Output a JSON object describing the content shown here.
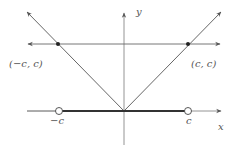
{
  "diagram": {
    "axes": {
      "x_label": "x",
      "y_label": "y"
    },
    "points": [
      {
        "label": "(−c, c)",
        "type": "filled"
      },
      {
        "label": "(c, c)",
        "type": "filled"
      }
    ],
    "x_ticks": [
      {
        "label": "−c",
        "marker": "open-circle"
      },
      {
        "label": "c",
        "marker": "open-circle"
      }
    ],
    "curves": [
      {
        "name": "y = |x|",
        "description": "V-shaped graph through origin"
      },
      {
        "name": "y = c",
        "description": "horizontal line"
      },
      {
        "name": "interval (−c, c)",
        "description": "bold segment on x-axis with open endpoints"
      }
    ],
    "colors": {
      "line": "#555555",
      "bold": "#333333"
    }
  }
}
